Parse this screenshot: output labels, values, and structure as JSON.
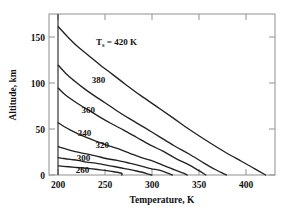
{
  "chart_data": {
    "type": "line",
    "title": "",
    "xlabel": "Temperature, K",
    "ylabel": "Altitude, km",
    "xlim": [
      190,
      432
    ],
    "ylim": [
      0,
      176
    ],
    "xticks": [
      200,
      250,
      300,
      350,
      400
    ],
    "xticklabels": [
      "200",
      "250",
      "300",
      "350",
      "400"
    ],
    "yticks": [
      0,
      50,
      100,
      150
    ],
    "yticklabels": [
      "0",
      "50",
      "100",
      "150"
    ],
    "grid": false,
    "legend": "inline-curve-labels",
    "annotations": [
      {
        "text": "Ts = 420 K",
        "symbol": "T",
        "subscript": "s",
        "rest": " = 420 K",
        "x": 268,
        "y": 140
      }
    ],
    "boundary_isotherm": {
      "label": "T = 200 K vertical boundary",
      "x": 200,
      "y_from": 0,
      "y_to": 176
    },
    "series": [
      {
        "name": "420",
        "label": "Ts = 420 K",
        "label_value": 420,
        "points": [
          [
            200,
            162
          ],
          [
            210,
            151
          ],
          [
            220,
            141
          ],
          [
            232,
            131
          ],
          [
            245,
            120
          ],
          [
            258,
            110
          ],
          [
            272,
            99
          ],
          [
            288,
            87
          ],
          [
            305,
            75
          ],
          [
            322,
            63
          ],
          [
            340,
            50
          ],
          [
            358,
            38
          ],
          [
            377,
            26
          ],
          [
            396,
            15
          ],
          [
            410,
            7
          ],
          [
            422,
            0
          ]
        ]
      },
      {
        "name": "380",
        "label": "380",
        "label_value": 380,
        "points": [
          [
            200,
            120
          ],
          [
            208,
            111
          ],
          [
            217,
            103
          ],
          [
            227,
            95
          ],
          [
            238,
            87
          ],
          [
            250,
            79
          ],
          [
            263,
            70
          ],
          [
            277,
            61
          ],
          [
            292,
            52
          ],
          [
            308,
            42
          ],
          [
            324,
            32
          ],
          [
            340,
            23
          ],
          [
            356,
            13
          ],
          [
            368,
            6
          ],
          [
            380,
            0
          ]
        ]
      },
      {
        "name": "360",
        "label": "360",
        "label_value": 360,
        "points": [
          [
            200,
            95
          ],
          [
            207,
            88
          ],
          [
            215,
            82
          ],
          [
            224,
            76
          ],
          [
            234,
            70
          ],
          [
            245,
            63
          ],
          [
            257,
            56
          ],
          [
            270,
            49
          ],
          [
            284,
            41
          ],
          [
            298,
            33
          ],
          [
            312,
            26
          ],
          [
            326,
            18
          ],
          [
            340,
            11
          ],
          [
            350,
            5
          ],
          [
            358,
            0
          ]
        ]
      },
      {
        "name": "340",
        "label": "340",
        "label_value": 340,
        "points": [
          [
            200,
            57
          ],
          [
            206,
            53
          ],
          [
            213,
            49
          ],
          [
            221,
            45
          ],
          [
            230,
            41
          ],
          [
            240,
            37
          ],
          [
            251,
            33
          ],
          [
            263,
            29
          ],
          [
            276,
            24
          ],
          [
            289,
            19
          ],
          [
            302,
            15
          ],
          [
            314,
            10
          ],
          [
            326,
            5
          ],
          [
            334,
            2
          ],
          [
            338,
            0
          ]
        ]
      },
      {
        "name": "320",
        "label": "320",
        "label_value": 320,
        "points": [
          [
            200,
            31
          ],
          [
            206,
            29
          ],
          [
            213,
            27
          ],
          [
            221,
            25
          ],
          [
            230,
            23
          ],
          [
            240,
            21
          ],
          [
            251,
            18
          ],
          [
            263,
            16
          ],
          [
            276,
            13
          ],
          [
            288,
            10
          ],
          [
            299,
            7
          ],
          [
            309,
            5
          ],
          [
            317,
            2
          ],
          [
            322,
            0
          ]
        ]
      },
      {
        "name": "300",
        "label": "300",
        "label_value": 300,
        "points": [
          [
            200,
            19
          ],
          [
            206,
            18
          ],
          [
            213,
            17
          ],
          [
            221,
            16
          ],
          [
            230,
            14
          ],
          [
            240,
            13
          ],
          [
            250,
            11
          ],
          [
            261,
            9
          ],
          [
            271,
            7
          ],
          [
            281,
            5
          ],
          [
            290,
            3
          ],
          [
            296,
            1
          ],
          [
            300,
            0
          ]
        ]
      },
      {
        "name": "260",
        "label": "260",
        "label_value": 260,
        "points": [
          [
            200,
            10
          ],
          [
            205,
            9.5
          ],
          [
            211,
            9
          ],
          [
            218,
            8.4
          ],
          [
            226,
            7.7
          ],
          [
            234,
            6.9
          ],
          [
            242,
            6.0
          ],
          [
            250,
            5.0
          ],
          [
            257,
            4.0
          ],
          [
            263,
            3.0
          ],
          [
            268,
            1.8
          ],
          [
            268,
            0
          ]
        ]
      }
    ],
    "curve_labels": [
      {
        "text": "380",
        "x": 243,
        "y": 104
      },
      {
        "text": "360",
        "x": 232,
        "y": 71
      },
      {
        "text": "340",
        "x": 228,
        "y": 46
      },
      {
        "text": "320",
        "x": 247,
        "y": 33
      },
      {
        "text": "300",
        "x": 227,
        "y": 19
      },
      {
        "text": "260",
        "x": 226,
        "y": 6
      }
    ]
  }
}
